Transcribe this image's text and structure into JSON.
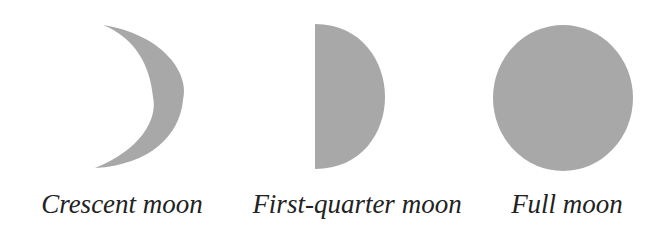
{
  "diagram": {
    "fill_color": "#a8a8a8",
    "text_color": "#222222",
    "phases": [
      {
        "id": "crescent",
        "label": "Crescent moon",
        "shape": "crescent"
      },
      {
        "id": "first-quarter",
        "label": "First-quarter moon",
        "shape": "half-disc"
      },
      {
        "id": "full",
        "label": "Full moon",
        "shape": "disc"
      }
    ]
  }
}
